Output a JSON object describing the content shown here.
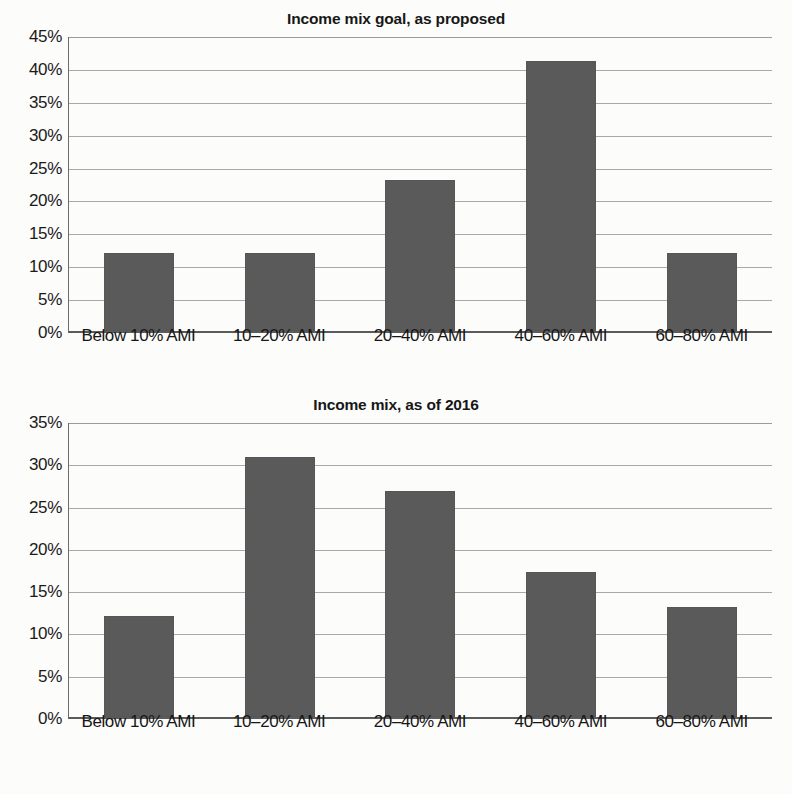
{
  "chart_data": [
    {
      "type": "bar",
      "title": "Income mix goal, as proposed",
      "categories": [
        "Below 10% AMI",
        "10–20% AMI",
        "20–40% AMI",
        "40–60% AMI",
        "60–80% AMI"
      ],
      "values": [
        11.9,
        11.9,
        23.0,
        41.0,
        11.8
      ],
      "value_labels": [
        "11.9%",
        "11.9%",
        "23.0%",
        "41.0%",
        "11.8%"
      ],
      "xlabel": "",
      "ylabel": "",
      "ylim": [
        0,
        45
      ],
      "ytick_step": 5,
      "yticks": [
        45,
        40,
        35,
        30,
        25,
        20,
        15,
        10,
        5,
        0
      ],
      "ytick_labels": [
        "45%",
        "40%",
        "35%",
        "30%",
        "25%",
        "20%",
        "15%",
        "10%",
        "5%",
        "0%"
      ],
      "grid": true,
      "legend": false,
      "bar_color": "#5a5a5a",
      "gridline_color": "#9a9a9a",
      "axis_color": "#5b5b5b"
    },
    {
      "type": "bar",
      "title": "Income mix, as of 2016",
      "categories": [
        "Below 10% AMI",
        "10–20% AMI",
        "20–40% AMI",
        "40–60% AMI",
        "60–80% AMI"
      ],
      "values": [
        12.0,
        30.7,
        26.7,
        17.2,
        13.0
      ],
      "value_labels": [
        "12.0%",
        "30.7%",
        "26.7%",
        "17.2%",
        "13.0%"
      ],
      "xlabel": "",
      "ylabel": "",
      "ylim": [
        0,
        35
      ],
      "ytick_step": 5,
      "yticks": [
        35,
        30,
        25,
        20,
        15,
        10,
        5,
        0
      ],
      "ytick_labels": [
        "35%",
        "30%",
        "25%",
        "20%",
        "15%",
        "10%",
        "5%",
        "0%"
      ],
      "grid": true,
      "legend": false,
      "bar_color": "#5a5a5a",
      "gridline_color": "#9a9a9a",
      "axis_color": "#5b5b5b"
    }
  ]
}
